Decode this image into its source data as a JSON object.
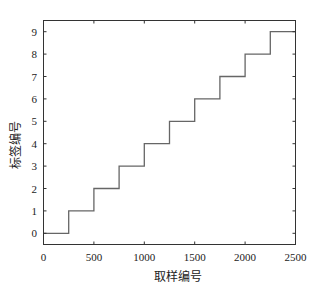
{
  "chart_data": {
    "type": "line",
    "drawstyle": "steps-post",
    "title": "",
    "xlabel": "取样编号",
    "ylabel": "标签编号",
    "xlim": [
      0,
      2500
    ],
    "ylim": [
      -0.5,
      9.5
    ],
    "xticks": [
      0,
      500,
      1000,
      1500,
      2000,
      2500
    ],
    "xtick_labels": [
      "0",
      "500",
      "1000",
      "1500",
      "2000",
      "2500"
    ],
    "yticks": [
      0,
      1,
      2,
      3,
      4,
      5,
      6,
      7,
      8,
      9
    ],
    "ytick_labels": [
      "0",
      "1",
      "2",
      "3",
      "4",
      "5",
      "6",
      "7",
      "8",
      "9"
    ],
    "grid": false,
    "legend": null,
    "series": [
      {
        "name": "label",
        "color": "#666666",
        "x": [
          0,
          250,
          500,
          750,
          1000,
          1250,
          1500,
          1750,
          2000,
          2250,
          2500
        ],
        "y": [
          0,
          1,
          2,
          3,
          4,
          5,
          6,
          7,
          8,
          9,
          9
        ]
      }
    ]
  },
  "colors": {
    "axis": "#333333",
    "line": "#666666",
    "background": "#ffffff"
  }
}
